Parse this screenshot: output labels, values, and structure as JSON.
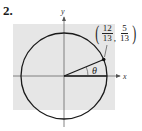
{
  "problem": {
    "number": "2."
  },
  "figure": {
    "type": "unit-circle",
    "axes": {
      "x_label": "x",
      "y_label": "y"
    },
    "angle_label": "θ",
    "point": {
      "x_num": "12",
      "x_den": "13",
      "y_num": "5",
      "y_den": "13",
      "comma": ","
    },
    "colors": {
      "background_box": "#e6e6e6",
      "circle": "#1a1a1a",
      "axes": "#555555",
      "point": "#111111"
    }
  }
}
